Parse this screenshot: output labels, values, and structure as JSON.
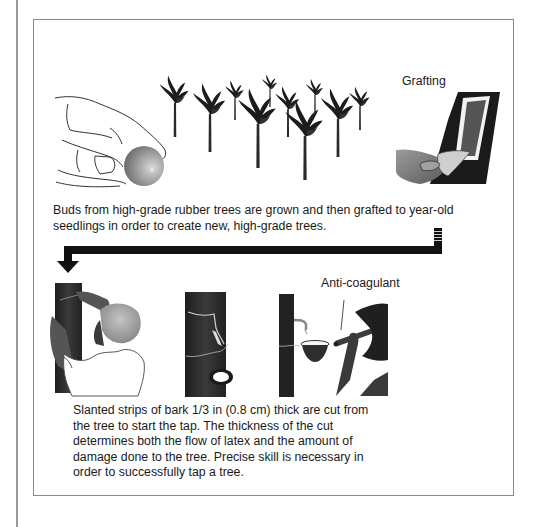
{
  "figure": {
    "panels": [
      {
        "id": "grafting",
        "labels": {
          "grafting": "Grafting"
        },
        "caption": "Buds from high-grade rubber trees are grown and then grafted to year-old seedlings in order to create new, high-grade trees."
      },
      {
        "id": "tapping",
        "labels": {
          "anti_coagulant": "Anti-coagulant"
        },
        "caption": "Slanted strips of bark 1/3 in (0.8 cm) thick are cut from the tree to start the tap. The thickness of the cut determines both the flow of latex and the amount of damage done to the tree. Precise skill is necessary in order to successfully tap a tree."
      }
    ],
    "colors": {
      "bark": "#2b2b2b",
      "frame": "#8a8a8a",
      "arrow": "#111111",
      "bud_gradient_start": "#d8d8d8",
      "bud_gradient_end": "#6a6a6a"
    }
  }
}
